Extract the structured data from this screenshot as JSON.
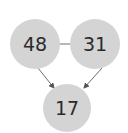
{
  "diagram": {
    "nodes": [
      {
        "id": "a",
        "label": "48",
        "color": "#d4d4d4"
      },
      {
        "id": "b",
        "label": "31",
        "color": "#d4d4d4"
      },
      {
        "id": "c",
        "label": "17",
        "color": "#d4d4d4"
      }
    ],
    "edges": [
      {
        "from": "a",
        "to": "b",
        "type": "line"
      },
      {
        "from": "a",
        "to": "c",
        "type": "arrow"
      },
      {
        "from": "b",
        "to": "c",
        "type": "arrow"
      }
    ]
  }
}
